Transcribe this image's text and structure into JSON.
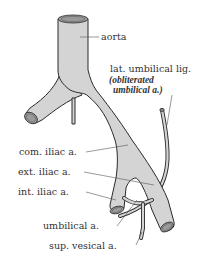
{
  "diagram": {
    "type": "anatomical illustration",
    "labels": {
      "aorta": "aorta",
      "lat_umbilical_lig": "lat. umbilical lig.",
      "obliterated_line1": "(obliterated",
      "obliterated_line2": "umbilical a.)",
      "com_iliac": "com. iliac a.",
      "ext_iliac": "ext. iliac a.",
      "int_iliac": "int. iliac a.",
      "umbilical": "umbilical a.",
      "sup_vesical": "sup. vesical a."
    },
    "colors": {
      "vessel_fill": "#d4d4d4",
      "outline": "#2a2a2a",
      "text": "#333333",
      "background": "#ffffff"
    }
  }
}
